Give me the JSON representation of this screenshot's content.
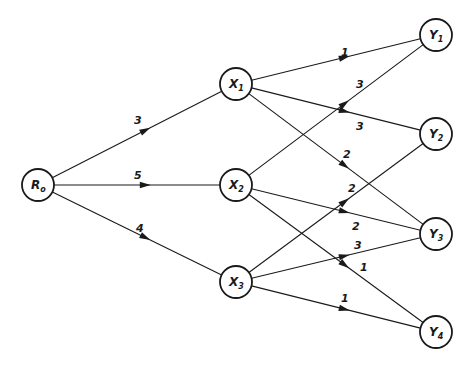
{
  "diagram": {
    "type": "directed-weighted-graph",
    "nodes": [
      {
        "id": "R0",
        "label": "R",
        "sub": "o",
        "x": 38,
        "y": 185
      },
      {
        "id": "X1",
        "label": "X",
        "sub": "1",
        "x": 236,
        "y": 84
      },
      {
        "id": "X2",
        "label": "X",
        "sub": "2",
        "x": 236,
        "y": 185
      },
      {
        "id": "X3",
        "label": "X",
        "sub": "3",
        "x": 236,
        "y": 282
      },
      {
        "id": "Y1",
        "label": "Y",
        "sub": "1",
        "x": 436,
        "y": 35
      },
      {
        "id": "Y2",
        "label": "Y",
        "sub": "2",
        "x": 436,
        "y": 134
      },
      {
        "id": "Y3",
        "label": "Y",
        "sub": "3",
        "x": 436,
        "y": 234
      },
      {
        "id": "Y4",
        "label": "Y",
        "sub": "4",
        "x": 436,
        "y": 332
      }
    ],
    "edges": [
      {
        "from": "R0",
        "to": "X1",
        "weight": "3",
        "lx": 134,
        "ly": 124
      },
      {
        "from": "R0",
        "to": "X2",
        "weight": "5",
        "lx": 134,
        "ly": 179
      },
      {
        "from": "R0",
        "to": "X3",
        "weight": "4",
        "lx": 136,
        "ly": 232
      },
      {
        "from": "X1",
        "to": "Y1",
        "weight": "1",
        "lx": 341,
        "ly": 56
      },
      {
        "from": "X1",
        "to": "Y2",
        "weight": "3",
        "lx": 356,
        "ly": 130
      },
      {
        "from": "X1",
        "to": "Y3",
        "weight": "2",
        "lx": 343,
        "ly": 158
      },
      {
        "from": "X2",
        "to": "Y1",
        "weight": "3",
        "lx": 356,
        "ly": 88
      },
      {
        "from": "X2",
        "to": "Y3",
        "weight": "2",
        "lx": 352,
        "ly": 230
      },
      {
        "from": "X2",
        "to": "Y4",
        "weight": "1",
        "lx": 360,
        "ly": 271
      },
      {
        "from": "X3",
        "to": "Y2",
        "weight": "2",
        "lx": 348,
        "ly": 192
      },
      {
        "from": "X3",
        "to": "Y3",
        "weight": "3",
        "lx": 354,
        "ly": 249
      },
      {
        "from": "X3",
        "to": "Y4",
        "weight": "1",
        "lx": 341,
        "ly": 302
      }
    ],
    "node_radius": 16,
    "stroke_color": "#1a1a1a"
  }
}
